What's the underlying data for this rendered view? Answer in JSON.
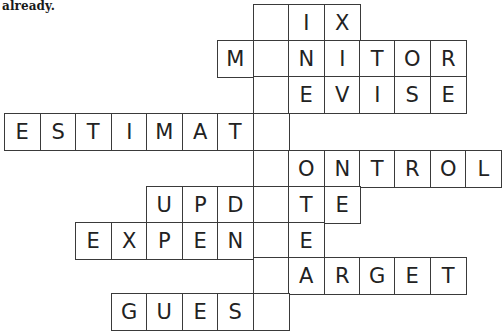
{
  "caption": "already.",
  "puzzle": {
    "type": "crossword",
    "key_column": 7,
    "rows": [
      {
        "word_fragment": "IX",
        "cells": [
          {
            "col": 7,
            "letter": ""
          },
          {
            "col": 8,
            "letter": "I"
          },
          {
            "col": 9,
            "letter": "X"
          }
        ]
      },
      {
        "word_fragment": "M NITOR",
        "cells": [
          {
            "col": 6,
            "letter": "M"
          },
          {
            "col": 7,
            "letter": ""
          },
          {
            "col": 8,
            "letter": "N"
          },
          {
            "col": 9,
            "letter": "I"
          },
          {
            "col": 10,
            "letter": "T"
          },
          {
            "col": 11,
            "letter": "O"
          },
          {
            "col": 12,
            "letter": "R"
          }
        ]
      },
      {
        "word_fragment": "EVISE",
        "cells": [
          {
            "col": 7,
            "letter": ""
          },
          {
            "col": 8,
            "letter": "E"
          },
          {
            "col": 9,
            "letter": "V"
          },
          {
            "col": 10,
            "letter": "I"
          },
          {
            "col": 11,
            "letter": "S"
          },
          {
            "col": 12,
            "letter": "E"
          }
        ]
      },
      {
        "word_fragment": "ESTIMAT",
        "cells": [
          {
            "col": 0,
            "letter": "E"
          },
          {
            "col": 1,
            "letter": "S"
          },
          {
            "col": 2,
            "letter": "T"
          },
          {
            "col": 3,
            "letter": "I"
          },
          {
            "col": 4,
            "letter": "M"
          },
          {
            "col": 5,
            "letter": "A"
          },
          {
            "col": 6,
            "letter": "T"
          },
          {
            "col": 7,
            "letter": ""
          }
        ]
      },
      {
        "word_fragment": "ONTROL",
        "cells": [
          {
            "col": 7,
            "letter": ""
          },
          {
            "col": 8,
            "letter": "O"
          },
          {
            "col": 9,
            "letter": "N"
          },
          {
            "col": 10,
            "letter": "T"
          },
          {
            "col": 11,
            "letter": "R"
          },
          {
            "col": 12,
            "letter": "O"
          },
          {
            "col": 13,
            "letter": "L"
          }
        ]
      },
      {
        "word_fragment": "UPD TE",
        "cells": [
          {
            "col": 4,
            "letter": "U"
          },
          {
            "col": 5,
            "letter": "P"
          },
          {
            "col": 6,
            "letter": "D"
          },
          {
            "col": 7,
            "letter": ""
          },
          {
            "col": 8,
            "letter": "T"
          },
          {
            "col": 9,
            "letter": "E"
          }
        ]
      },
      {
        "word_fragment": "EXPEN E",
        "cells": [
          {
            "col": 2,
            "letter": "E"
          },
          {
            "col": 3,
            "letter": "X"
          },
          {
            "col": 4,
            "letter": "P"
          },
          {
            "col": 5,
            "letter": "E"
          },
          {
            "col": 6,
            "letter": "N"
          },
          {
            "col": 7,
            "letter": ""
          },
          {
            "col": 8,
            "letter": "E"
          }
        ]
      },
      {
        "word_fragment": "ARGET",
        "cells": [
          {
            "col": 7,
            "letter": ""
          },
          {
            "col": 8,
            "letter": "A"
          },
          {
            "col": 9,
            "letter": "R"
          },
          {
            "col": 10,
            "letter": "G"
          },
          {
            "col": 11,
            "letter": "E"
          },
          {
            "col": 12,
            "letter": "T"
          }
        ]
      },
      {
        "word_fragment": "GUES",
        "cells": [
          {
            "col": 3,
            "letter": "G"
          },
          {
            "col": 4,
            "letter": "U"
          },
          {
            "col": 5,
            "letter": "E"
          },
          {
            "col": 6,
            "letter": "S"
          },
          {
            "col": 7,
            "letter": ""
          }
        ]
      }
    ]
  },
  "colors": {
    "border": "#3a3a3a",
    "text": "#222222",
    "background": "#ffffff"
  }
}
